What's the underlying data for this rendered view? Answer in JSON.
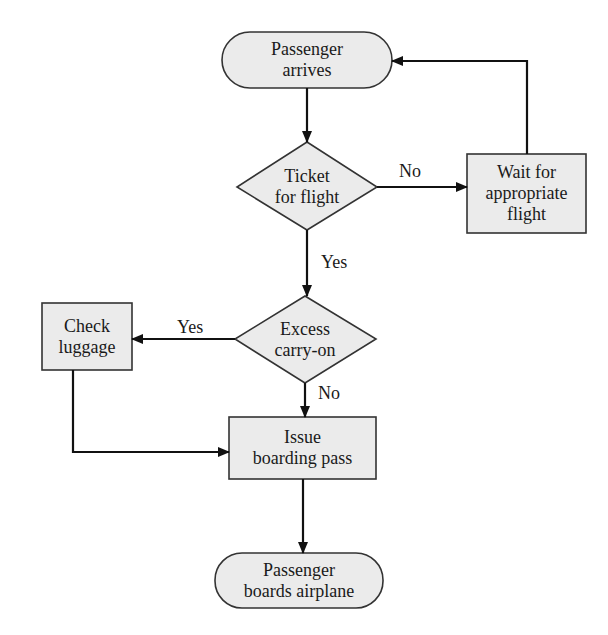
{
  "diagram": {
    "type": "flowchart",
    "colors": {
      "fill": "#ebebeb",
      "stroke": "#333333",
      "line": "#111111",
      "background": "#ffffff"
    },
    "nodes": [
      {
        "id": "start",
        "shape": "terminal",
        "label": "Passenger\narrives"
      },
      {
        "id": "ticket",
        "shape": "decision",
        "label": "Ticket\nfor flight"
      },
      {
        "id": "wait",
        "shape": "process",
        "label": "Wait for\nappropriate\nflight"
      },
      {
        "id": "excess",
        "shape": "decision",
        "label": "Excess\ncarry-on"
      },
      {
        "id": "luggage",
        "shape": "process",
        "label": "Check\nluggage"
      },
      {
        "id": "issue",
        "shape": "process",
        "label": "Issue\nboarding pass"
      },
      {
        "id": "end",
        "shape": "terminal",
        "label": "Passenger\nboards airplane"
      }
    ],
    "edges": [
      {
        "from": "start",
        "to": "ticket",
        "label": ""
      },
      {
        "from": "ticket",
        "to": "wait",
        "label": "No"
      },
      {
        "from": "wait",
        "to": "start",
        "label": ""
      },
      {
        "from": "ticket",
        "to": "excess",
        "label": "Yes"
      },
      {
        "from": "excess",
        "to": "luggage",
        "label": "Yes"
      },
      {
        "from": "excess",
        "to": "issue",
        "label": "No"
      },
      {
        "from": "luggage",
        "to": "issue",
        "label": ""
      },
      {
        "from": "issue",
        "to": "end",
        "label": ""
      }
    ]
  }
}
